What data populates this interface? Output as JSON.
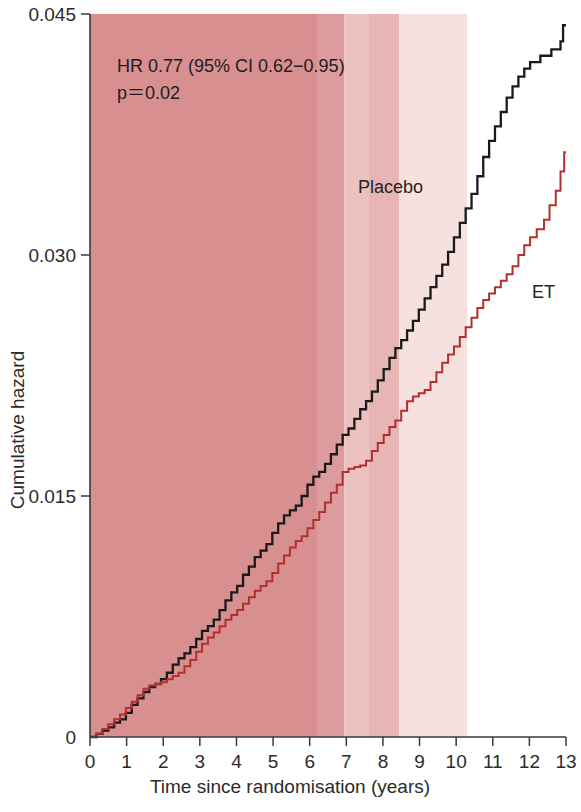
{
  "chart_data": {
    "type": "line",
    "title": "",
    "xlabel": "Time since randomisation  (years)",
    "ylabel": "Cumulative hazard",
    "xlim": [
      0,
      13
    ],
    "ylim": [
      0,
      0.045
    ],
    "xticks": [
      "0",
      "1",
      "2",
      "3",
      "4",
      "5",
      "6",
      "7",
      "8",
      "9",
      "10",
      "11",
      "12",
      "13"
    ],
    "xtick_values": [
      0,
      1,
      2,
      3,
      4,
      5,
      6,
      7,
      8,
      9,
      10,
      11,
      12,
      13
    ],
    "yticks": [
      "0",
      "0.015",
      "0.030",
      "0.045"
    ],
    "ytick_values": [
      0,
      0.015,
      0.03,
      0.045
    ],
    "grid": false,
    "legend_position": "inline-annotation",
    "annotations": [
      {
        "name": "hazard-ratio",
        "text": "HR 0.77  (95% CI 0.62−0.95)",
        "x": 0.55,
        "y": 0.0415
      },
      {
        "name": "p-value",
        "text": "p＝0.02",
        "x": 0.55,
        "y": 0.0395
      }
    ],
    "series": [
      {
        "name": "Placebo",
        "color": "#1a1a1a",
        "label_x": 7.3,
        "label_y": 0.0335,
        "final_value": 0.0443,
        "points": [
          [
            0.0,
            0.0
          ],
          [
            0.18,
            0.0002
          ],
          [
            0.34,
            0.0004
          ],
          [
            0.5,
            0.0006
          ],
          [
            0.66,
            0.0009
          ],
          [
            0.82,
            0.0011
          ],
          [
            0.98,
            0.0015
          ],
          [
            1.14,
            0.002
          ],
          [
            1.3,
            0.0024
          ],
          [
            1.46,
            0.0028
          ],
          [
            1.62,
            0.0031
          ],
          [
            1.78,
            0.0033
          ],
          [
            1.94,
            0.0036
          ],
          [
            2.1,
            0.004
          ],
          [
            2.26,
            0.0045
          ],
          [
            2.42,
            0.0049
          ],
          [
            2.58,
            0.0052
          ],
          [
            2.74,
            0.0056
          ],
          [
            2.9,
            0.0061
          ],
          [
            3.06,
            0.0066
          ],
          [
            3.22,
            0.0069
          ],
          [
            3.38,
            0.0073
          ],
          [
            3.54,
            0.0079
          ],
          [
            3.7,
            0.0085
          ],
          [
            3.86,
            0.009
          ],
          [
            4.02,
            0.0094
          ],
          [
            4.18,
            0.0101
          ],
          [
            4.34,
            0.0106
          ],
          [
            4.5,
            0.0112
          ],
          [
            4.66,
            0.0116
          ],
          [
            4.82,
            0.012
          ],
          [
            4.98,
            0.0127
          ],
          [
            5.14,
            0.0133
          ],
          [
            5.3,
            0.0138
          ],
          [
            5.46,
            0.0141
          ],
          [
            5.62,
            0.0144
          ],
          [
            5.78,
            0.015
          ],
          [
            5.94,
            0.0157
          ],
          [
            6.1,
            0.0162
          ],
          [
            6.26,
            0.0165
          ],
          [
            6.42,
            0.017
          ],
          [
            6.58,
            0.0176
          ],
          [
            6.74,
            0.0182
          ],
          [
            6.9,
            0.0188
          ],
          [
            7.06,
            0.0192
          ],
          [
            7.22,
            0.0198
          ],
          [
            7.38,
            0.0204
          ],
          [
            7.54,
            0.0209
          ],
          [
            7.7,
            0.0215
          ],
          [
            7.86,
            0.0222
          ],
          [
            8.02,
            0.0229
          ],
          [
            8.18,
            0.0236
          ],
          [
            8.34,
            0.0242
          ],
          [
            8.5,
            0.0247
          ],
          [
            8.66,
            0.0253
          ],
          [
            8.82,
            0.0259
          ],
          [
            8.98,
            0.0266
          ],
          [
            9.14,
            0.0273
          ],
          [
            9.3,
            0.028
          ],
          [
            9.46,
            0.0287
          ],
          [
            9.62,
            0.0294
          ],
          [
            9.78,
            0.0302
          ],
          [
            9.94,
            0.0311
          ],
          [
            10.1,
            0.032
          ],
          [
            10.26,
            0.0329
          ],
          [
            10.42,
            0.0338
          ],
          [
            10.58,
            0.0349
          ],
          [
            10.74,
            0.0361
          ],
          [
            10.9,
            0.0371
          ],
          [
            11.06,
            0.038
          ],
          [
            11.22,
            0.0389
          ],
          [
            11.38,
            0.0398
          ],
          [
            11.54,
            0.0405
          ],
          [
            11.7,
            0.0411
          ],
          [
            11.86,
            0.0416
          ],
          [
            12.02,
            0.042
          ],
          [
            12.3,
            0.0424
          ],
          [
            12.6,
            0.0428
          ],
          [
            12.85,
            0.0433
          ],
          [
            12.92,
            0.0443
          ],
          [
            13.0,
            0.0443
          ]
        ]
      },
      {
        "name": "ET",
        "color": "#b2302c",
        "label_x": 11.6,
        "label_y": 0.0272,
        "final_value": 0.0364,
        "points": [
          [
            0.0,
            0.0
          ],
          [
            0.18,
            0.0002
          ],
          [
            0.34,
            0.0005
          ],
          [
            0.5,
            0.0008
          ],
          [
            0.66,
            0.0011
          ],
          [
            0.82,
            0.0014
          ],
          [
            0.98,
            0.0018
          ],
          [
            1.14,
            0.0022
          ],
          [
            1.3,
            0.0026
          ],
          [
            1.46,
            0.003
          ],
          [
            1.62,
            0.0032
          ],
          [
            1.78,
            0.0033
          ],
          [
            1.94,
            0.0034
          ],
          [
            2.1,
            0.0036
          ],
          [
            2.26,
            0.0038
          ],
          [
            2.42,
            0.004
          ],
          [
            2.58,
            0.0044
          ],
          [
            2.74,
            0.0048
          ],
          [
            2.9,
            0.0053
          ],
          [
            3.06,
            0.0058
          ],
          [
            3.22,
            0.0062
          ],
          [
            3.38,
            0.0065
          ],
          [
            3.54,
            0.0069
          ],
          [
            3.7,
            0.0073
          ],
          [
            3.86,
            0.0076
          ],
          [
            4.02,
            0.0079
          ],
          [
            4.18,
            0.0083
          ],
          [
            4.34,
            0.0087
          ],
          [
            4.5,
            0.0091
          ],
          [
            4.66,
            0.0094
          ],
          [
            4.82,
            0.0097
          ],
          [
            4.98,
            0.0102
          ],
          [
            5.14,
            0.0108
          ],
          [
            5.3,
            0.0113
          ],
          [
            5.46,
            0.0118
          ],
          [
            5.62,
            0.0122
          ],
          [
            5.78,
            0.0125
          ],
          [
            5.94,
            0.013
          ],
          [
            6.1,
            0.0135
          ],
          [
            6.26,
            0.014
          ],
          [
            6.42,
            0.0146
          ],
          [
            6.58,
            0.0152
          ],
          [
            6.74,
            0.0157
          ],
          [
            6.9,
            0.0165
          ],
          [
            7.06,
            0.0167
          ],
          [
            7.22,
            0.0168
          ],
          [
            7.38,
            0.0169
          ],
          [
            7.54,
            0.0172
          ],
          [
            7.7,
            0.0178
          ],
          [
            7.86,
            0.0183
          ],
          [
            8.02,
            0.0188
          ],
          [
            8.18,
            0.0193
          ],
          [
            8.34,
            0.0197
          ],
          [
            8.5,
            0.0203
          ],
          [
            8.66,
            0.0209
          ],
          [
            8.82,
            0.0212
          ],
          [
            8.98,
            0.0214
          ],
          [
            9.14,
            0.0216
          ],
          [
            9.3,
            0.0221
          ],
          [
            9.46,
            0.0227
          ],
          [
            9.62,
            0.0233
          ],
          [
            9.78,
            0.0238
          ],
          [
            9.94,
            0.0243
          ],
          [
            10.1,
            0.0249
          ],
          [
            10.26,
            0.0255
          ],
          [
            10.42,
            0.0261
          ],
          [
            10.58,
            0.0267
          ],
          [
            10.74,
            0.0272
          ],
          [
            10.9,
            0.0276
          ],
          [
            11.06,
            0.028
          ],
          [
            11.22,
            0.0284
          ],
          [
            11.38,
            0.0288
          ],
          [
            11.54,
            0.0293
          ],
          [
            11.7,
            0.03
          ],
          [
            11.86,
            0.0306
          ],
          [
            12.02,
            0.0311
          ],
          [
            12.2,
            0.0316
          ],
          [
            12.4,
            0.0322
          ],
          [
            12.55,
            0.0331
          ],
          [
            12.72,
            0.034
          ],
          [
            12.85,
            0.0352
          ],
          [
            12.95,
            0.0364
          ],
          [
            13.0,
            0.0364
          ]
        ]
      }
    ],
    "shaded_bands": [
      {
        "name": "band-0-6.2",
        "from": 0.0,
        "to": 6.2,
        "color": "#d78f90"
      },
      {
        "name": "band-6.2-6.95",
        "from": 6.2,
        "to": 6.95,
        "color": "#dc9b9c"
      },
      {
        "name": "band-6.95-7.6",
        "from": 6.95,
        "to": 7.6,
        "color": "#ecc2c0"
      },
      {
        "name": "band-7.6-8.45",
        "from": 7.6,
        "to": 8.45,
        "color": "#e6b5b4"
      },
      {
        "name": "band-8.45-10.3",
        "from": 8.45,
        "to": 10.3,
        "color": "#f6e1df"
      }
    ]
  },
  "axis": {
    "x_title": "Time since randomisation  (years)",
    "y_title": "Cumulative hazard"
  }
}
